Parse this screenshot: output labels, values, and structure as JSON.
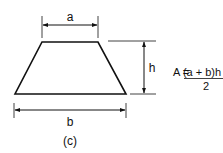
{
  "diagram": {
    "shape": "trapezoid",
    "caption": "(c)",
    "labels": {
      "top_base": "a",
      "bottom_base": "b",
      "height": "h"
    },
    "formula": {
      "lhs": "A = ",
      "numerator": "(a + b)h",
      "denominator": "2"
    },
    "colors": {
      "stroke": "#111111",
      "background": "#ffffff"
    }
  }
}
